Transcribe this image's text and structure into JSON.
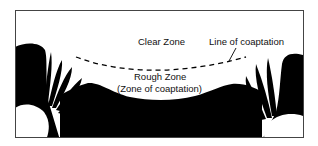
{
  "diagram": {
    "labels": {
      "clear_zone": "Clear Zone",
      "line_of_coaptation": "Line of coaptation",
      "rough_zone": "Rough Zone",
      "zone_of_coaptation": "(Zone of coaptation)"
    },
    "colors": {
      "fill": "#000000",
      "background": "#ffffff",
      "frame": "#444444"
    }
  }
}
